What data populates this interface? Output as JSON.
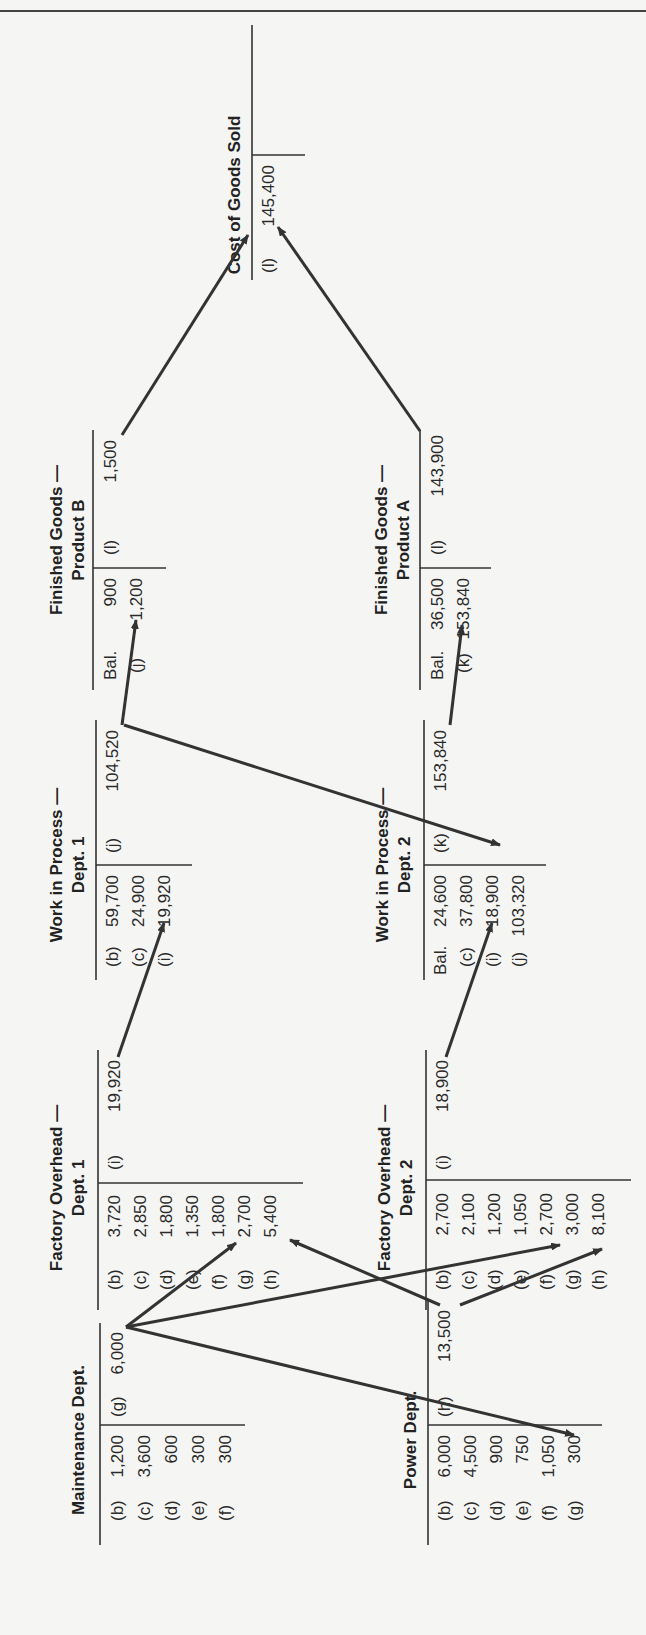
{
  "orientation": "rotated-90-ccw",
  "accounts": [
    {
      "id": "maintenance",
      "title": [
        "Maintenance Dept."
      ],
      "debits": [
        {
          "ref": "(b)",
          "amount": "1,200"
        },
        {
          "ref": "(c)",
          "amount": "3,600"
        },
        {
          "ref": "(d)",
          "amount": "600"
        },
        {
          "ref": "(e)",
          "amount": "300"
        },
        {
          "ref": "(f)",
          "amount": "300"
        }
      ],
      "credits": [
        {
          "ref": "(g)",
          "amount": "6,000"
        }
      ]
    },
    {
      "id": "power",
      "title": [
        "Power Dept."
      ],
      "debits": [
        {
          "ref": "(b)",
          "amount": "6,000"
        },
        {
          "ref": "(c)",
          "amount": "4,500"
        },
        {
          "ref": "(d)",
          "amount": "900"
        },
        {
          "ref": "(e)",
          "amount": "750"
        },
        {
          "ref": "(f)",
          "amount": "1,050"
        },
        {
          "ref": "(g)",
          "amount": "300"
        }
      ],
      "credits": [
        {
          "ref": "(h)",
          "amount": "13,500"
        }
      ]
    },
    {
      "id": "foh1",
      "title": [
        "Factory Overhead —",
        "Dept. 1"
      ],
      "debits": [
        {
          "ref": "(b)",
          "amount": "3,720"
        },
        {
          "ref": "(c)",
          "amount": "2,850"
        },
        {
          "ref": "(d)",
          "amount": "1,800"
        },
        {
          "ref": "(e)",
          "amount": "1,350"
        },
        {
          "ref": "(f)",
          "amount": "1,800"
        },
        {
          "ref": "(g)",
          "amount": "2,700"
        },
        {
          "ref": "(h)",
          "amount": "5,400"
        }
      ],
      "credits": [
        {
          "ref": "(i)",
          "amount": "19,920"
        }
      ]
    },
    {
      "id": "foh2",
      "title": [
        "Factory Overhead —",
        "Dept. 2"
      ],
      "debits": [
        {
          "ref": "(b)",
          "amount": "2,700"
        },
        {
          "ref": "(c)",
          "amount": "2,100"
        },
        {
          "ref": "(d)",
          "amount": "1,200"
        },
        {
          "ref": "(e)",
          "amount": "1,050"
        },
        {
          "ref": "(f)",
          "amount": "2,700"
        },
        {
          "ref": "(g)",
          "amount": "3,000"
        },
        {
          "ref": "(h)",
          "amount": "8,100"
        }
      ],
      "credits": [
        {
          "ref": "(i)",
          "amount": "18,900"
        }
      ]
    },
    {
      "id": "wip1",
      "title": [
        "Work in Process —",
        "Dept. 1"
      ],
      "debits": [
        {
          "ref": "(b)",
          "amount": "59,700"
        },
        {
          "ref": "(c)",
          "amount": "24,900"
        },
        {
          "ref": "(i)",
          "amount": "19,920"
        }
      ],
      "credits": [
        {
          "ref": "(j)",
          "amount": "104,520"
        }
      ]
    },
    {
      "id": "wip2",
      "title": [
        "Work in Process —",
        "Dept. 2"
      ],
      "debits": [
        {
          "ref": "Bal.",
          "amount": "24,600"
        },
        {
          "ref": "(c)",
          "amount": "37,800"
        },
        {
          "ref": "(i)",
          "amount": "18,900"
        },
        {
          "ref": "(j)",
          "amount": "103,320"
        }
      ],
      "credits": [
        {
          "ref": "(k)",
          "amount": "153,840"
        }
      ]
    },
    {
      "id": "fgb",
      "title": [
        "Finished Goods —",
        "Product B"
      ],
      "debits": [
        {
          "ref": "Bal.",
          "amount": "900"
        },
        {
          "ref": "(j)",
          "amount": "1,200"
        }
      ],
      "credits": [
        {
          "ref": "(l)",
          "amount": "1,500"
        }
      ]
    },
    {
      "id": "fga",
      "title": [
        "Finished Goods —",
        "Product A"
      ],
      "debits": [
        {
          "ref": "Bal.",
          "amount": "36,500"
        },
        {
          "ref": "(k)",
          "amount": "153,840"
        }
      ],
      "credits": [
        {
          "ref": "(l)",
          "amount": "143,900"
        }
      ]
    },
    {
      "id": "cogs",
      "title": [
        "Cost of Goods Sold"
      ],
      "debits": [
        {
          "ref": "(l)",
          "amount": "145,400"
        }
      ],
      "credits": []
    }
  ],
  "flows": [
    {
      "from": "maintenance.credit.(g) 6,000",
      "to": "foh1.debit.(g) 2,700"
    },
    {
      "from": "maintenance.credit.(g) 6,000",
      "to": "foh2.debit.(g) 3,000"
    },
    {
      "from": "maintenance.credit.(g) 6,000",
      "to": "power.debit.(g) 300"
    },
    {
      "from": "power.credit.(h) 13,500",
      "to": "foh1.debit.(h) 5,400"
    },
    {
      "from": "power.credit.(h) 13,500",
      "to": "foh2.debit.(h) 8,100"
    },
    {
      "from": "foh1.credit.(i) 19,920",
      "to": "wip1.debit.(i) 19,920"
    },
    {
      "from": "foh2.credit.(i) 18,900",
      "to": "wip2.debit.(i) 18,900"
    },
    {
      "from": "wip1.credit.(j) 104,520",
      "to": "fgb.debit.(j) 1,200"
    },
    {
      "from": "wip1.credit.(j) 104,520",
      "to": "wip2.debit.(j) 103,320"
    },
    {
      "from": "wip2.credit.(k) 153,840",
      "to": "fga.debit.(k) 153,840"
    },
    {
      "from": "fgb.credit.(l) 1,500",
      "to": "cogs.debit.(l) 145,400"
    },
    {
      "from": "fga.credit.(l) 143,900",
      "to": "cogs.debit.(l) 145,400"
    }
  ]
}
